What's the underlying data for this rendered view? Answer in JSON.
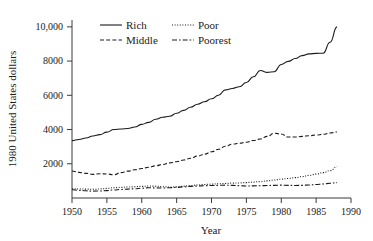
{
  "chart_data": {
    "type": "line",
    "title": "",
    "xlabel": "Year",
    "ylabel": "1980 United States dollars",
    "xlim": [
      1950,
      1990
    ],
    "ylim": [
      0,
      10400
    ],
    "grid": false,
    "legend_position": "top-left-inside",
    "xticks": [
      "1950",
      "1955",
      "1960",
      "1965",
      "1970",
      "1975",
      "1980",
      "1985",
      "1990"
    ],
    "xtick_values": [
      1950,
      1955,
      1960,
      1965,
      1970,
      1975,
      1980,
      1985,
      1990
    ],
    "yticks": [
      "2000",
      "4000",
      "6000",
      "8000",
      "10,000"
    ],
    "ytick_values": [
      2000,
      4000,
      6000,
      8000,
      10000
    ],
    "x": [
      1950,
      1951,
      1952,
      1953,
      1954,
      1955,
      1956,
      1957,
      1958,
      1959,
      1960,
      1961,
      1962,
      1963,
      1964,
      1965,
      1966,
      1967,
      1968,
      1969,
      1970,
      1971,
      1972,
      1973,
      1974,
      1975,
      1976,
      1977,
      1978,
      1979,
      1980,
      1981,
      1982,
      1983,
      1984,
      1985,
      1986,
      1987,
      1988
    ],
    "series": [
      {
        "name": "Rich",
        "style": "solid",
        "color": "#1a1a1a",
        "values": [
          3350,
          3420,
          3510,
          3620,
          3700,
          3850,
          4000,
          4030,
          4060,
          4150,
          4300,
          4420,
          4600,
          4720,
          4780,
          4950,
          5120,
          5300,
          5480,
          5620,
          5800,
          6000,
          6320,
          6400,
          6500,
          6750,
          7080,
          7450,
          7340,
          7380,
          7800,
          7980,
          8150,
          8320,
          8420,
          8450,
          8460,
          9100,
          10000
        ]
      },
      {
        "name": "Middle",
        "style": "dashed",
        "color": "#1a1a1a",
        "values": [
          1580,
          1500,
          1440,
          1380,
          1420,
          1400,
          1360,
          1480,
          1570,
          1650,
          1720,
          1800,
          1880,
          1960,
          2050,
          2120,
          2220,
          2320,
          2450,
          2560,
          2700,
          2850,
          3020,
          3150,
          3200,
          3260,
          3360,
          3450,
          3600,
          3780,
          3740,
          3560,
          3560,
          3600,
          3640,
          3680,
          3720,
          3800,
          3860
        ]
      },
      {
        "name": "Poor",
        "style": "dotted",
        "color": "#1a1a1a",
        "values": [
          540,
          530,
          520,
          510,
          530,
          560,
          600,
          620,
          640,
          660,
          680,
          700,
          690,
          660,
          640,
          650,
          690,
          730,
          760,
          790,
          810,
          830,
          850,
          870,
          880,
          900,
          930,
          960,
          1000,
          1050,
          1100,
          1140,
          1190,
          1250,
          1320,
          1400,
          1480,
          1600,
          1830
        ]
      },
      {
        "name": "Poorest",
        "style": "dashdot",
        "color": "#1a1a1a",
        "values": [
          480,
          450,
          420,
          400,
          410,
          430,
          470,
          500,
          520,
          540,
          570,
          600,
          590,
          580,
          600,
          620,
          650,
          680,
          700,
          720,
          730,
          740,
          750,
          740,
          720,
          700,
          710,
          720,
          730,
          740,
          750,
          740,
          730,
          740,
          760,
          790,
          820,
          860,
          900
        ]
      }
    ],
    "legend": [
      {
        "label": "Rich",
        "style": "solid"
      },
      {
        "label": "Poor",
        "style": "dotted"
      },
      {
        "label": "Middle",
        "style": "dashed"
      },
      {
        "label": "Poorest",
        "style": "dashdot"
      }
    ]
  }
}
